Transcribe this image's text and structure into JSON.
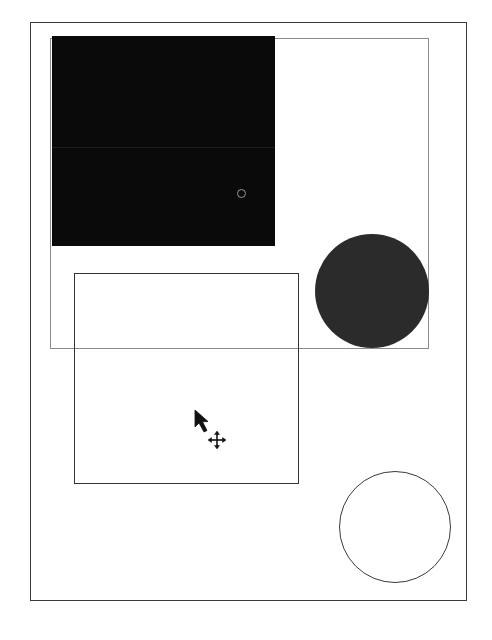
{
  "canvas": {
    "background": "#ffffff",
    "page_frame": {
      "x": 30,
      "y": 22,
      "w": 437,
      "h": 579,
      "stroke": "#3a3a3a"
    }
  },
  "shapes": [
    {
      "id": "selection-rect",
      "type": "rect",
      "x": 50,
      "y": 38,
      "w": 379,
      "h": 311,
      "fill": "none",
      "stroke": "#8a8a8a"
    },
    {
      "id": "black-rect",
      "type": "rect",
      "x": 52,
      "y": 36,
      "w": 223,
      "h": 210,
      "fill": "#0a0a0a"
    },
    {
      "id": "outline-rect",
      "type": "rect",
      "x": 74,
      "y": 273,
      "w": 225,
      "h": 211,
      "fill": "none",
      "stroke": "#333333"
    },
    {
      "id": "filled-circle",
      "type": "circle",
      "cx": 372,
      "cy": 291,
      "r": 57,
      "fill": "#2b2b2b"
    },
    {
      "id": "outline-circle",
      "type": "circle",
      "cx": 395,
      "cy": 527,
      "r": 56,
      "fill": "none",
      "stroke": "#3a3a3a"
    }
  ],
  "handle": {
    "cx": 241,
    "cy": 193,
    "r": 4,
    "stroke": "#9a9a9a"
  },
  "cursor": {
    "type": "move-arrow-cursor",
    "x": 194,
    "y": 409
  }
}
